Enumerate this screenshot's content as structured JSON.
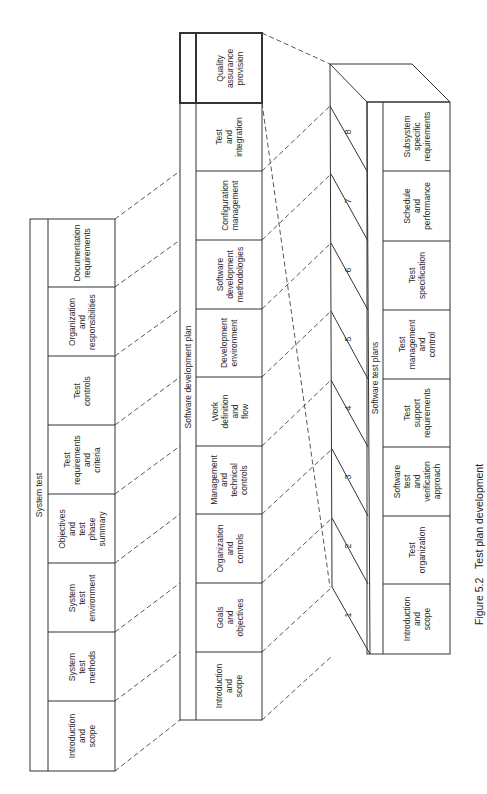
{
  "caption": {
    "figure": "Figure 5.2",
    "title": "Test plan development"
  },
  "system_test": {
    "title": "System test",
    "sections": [
      "Introduction\nand\nscope",
      "System\ntest\nmethods",
      "System\ntest\nenvironment",
      "Objectives\nand\ntest\nphase\nsummary",
      "Test\nrequirements\nand\ncriteria",
      "Test\ncontrols",
      "Organization\nand\nresponsibilities",
      "Documentation\nrequirements"
    ]
  },
  "software_development_plan": {
    "title": "Software development plan",
    "sections": [
      "Introduction\nand\nscope",
      "Goals\nand\nobjectives",
      "Organization\nand\ncontrols",
      "Management\nand\ntechnical\ncontrols",
      "Work\ndefinition\nand\nflow",
      "Development\nenvironment",
      "Software\ndevelopment\nmethodologies",
      "Configuration\nmanagement",
      "Test\nand\nintegration",
      "Quality\nassurance\nprovision"
    ],
    "highlighted_section": "Quality assurance provision"
  },
  "software_test_plans": {
    "title": "Software test plans",
    "numbers": [
      "1",
      "2",
      "3",
      "4",
      "5",
      "6",
      "7",
      "8"
    ],
    "sections": [
      "Introduction\nand\nscope",
      "Test\norganization",
      "Software\ntest\nand\nverification\napproach",
      "Test\nsupport\nrequirements",
      "Test\nmanagement\nand\ncontrol",
      "Test\nspecification",
      "Schedule\nand\nperformance",
      "Subsystem\nspecific\nrequirements"
    ]
  }
}
